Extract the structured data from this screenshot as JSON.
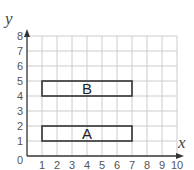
{
  "chart_data": {
    "type": "coordinate-grid",
    "xlabel": "x",
    "ylabel": "y",
    "xlim": [
      0,
      10
    ],
    "ylim": [
      0,
      8
    ],
    "grid": true,
    "x_ticks": [
      "1",
      "2",
      "3",
      "4",
      "5",
      "6",
      "7",
      "8",
      "9",
      "10"
    ],
    "y_ticks": [
      "1",
      "2",
      "3",
      "4",
      "5",
      "6",
      "7",
      "8"
    ],
    "origin_label": "0",
    "shapes": [
      {
        "label": "A",
        "type": "rectangle",
        "x1": 1,
        "y1": 1,
        "x2": 7,
        "y2": 2
      },
      {
        "label": "B",
        "type": "rectangle",
        "x1": 1,
        "y1": 4,
        "x2": 7,
        "y2": 5
      }
    ]
  },
  "colors": {
    "grid": "#cccccc",
    "axis": "#333333",
    "shape_stroke": "#333333"
  }
}
